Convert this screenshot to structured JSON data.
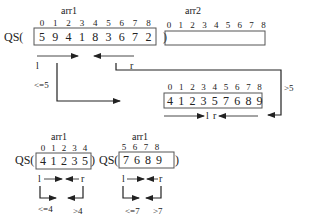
{
  "top": {
    "arr1": {
      "label": "arr1",
      "call_prefix": "QS(",
      "call_suffix": ")",
      "indices": [
        "0",
        "1",
        "2",
        "3",
        "4",
        "5",
        "6",
        "7",
        "8"
      ],
      "values": [
        "5",
        "9",
        "4",
        "1",
        "8",
        "3",
        "6",
        "7",
        "2"
      ],
      "left_pointer": "l",
      "right_pointer": "r"
    },
    "arr2": {
      "label": "arr2",
      "indices": [
        "0",
        "1",
        "2",
        "3",
        "4",
        "5",
        "6",
        "7",
        "8"
      ],
      "values": []
    }
  },
  "partitioned": {
    "indices": [
      "0",
      "1",
      "2",
      "3",
      "4",
      "5",
      "6",
      "7",
      "8"
    ],
    "values": [
      "4",
      "1",
      "2",
      "3",
      "5",
      "7",
      "6",
      "8",
      "9"
    ],
    "left_pointer": "l",
    "right_pointer": "r",
    "left_condition": "<=5",
    "right_condition": ">5"
  },
  "bottom_left": {
    "label": "arr1",
    "call_prefix": "QS(",
    "call_suffix": ")",
    "indices": [
      "0",
      "1",
      "2",
      "3",
      "4"
    ],
    "values": [
      "4",
      "1",
      "2",
      "3",
      "5"
    ],
    "left_pointer": "l",
    "right_pointer": "r",
    "left_condition": "<=4",
    "right_condition": ">4"
  },
  "bottom_right": {
    "label": "arr1",
    "call_prefix": "QS(",
    "call_suffix": ")",
    "indices": [
      "5",
      "6",
      "7",
      "8"
    ],
    "values": [
      "7",
      "6",
      "8",
      "9"
    ],
    "left_pointer": "l",
    "right_pointer": "r",
    "left_condition": "<=7",
    "right_condition": ">7"
  }
}
